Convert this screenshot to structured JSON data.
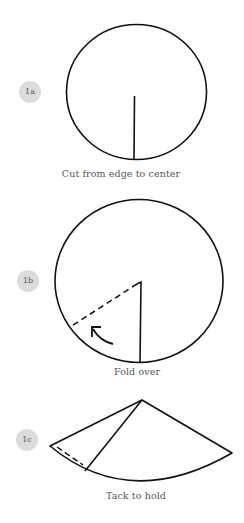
{
  "steps": [
    {
      "badge": "1a",
      "caption": "Cut from edge to center"
    },
    {
      "badge": "1b",
      "caption": "Fold over"
    },
    {
      "badge": "1c",
      "caption": "Tack to hold"
    }
  ],
  "colors": {
    "stroke": "#111111",
    "badge_bg": "#dcdcdc",
    "caption_text": "#555555"
  }
}
